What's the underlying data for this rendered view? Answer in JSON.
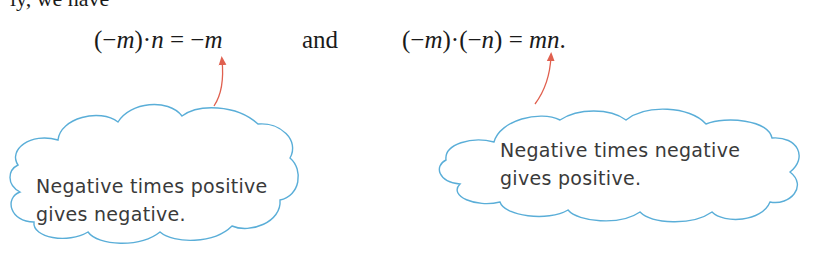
{
  "fragment_text": "ly, we have",
  "equations": {
    "left": {
      "lhs_open": "(−",
      "lhs_m": "m",
      "lhs_close": ")",
      "dot": "·",
      "lhs_n": "n",
      "eq": " = ",
      "rhs_sign": "−",
      "rhs_m": "m"
    },
    "conjunction": "and",
    "right": {
      "lhs_open1": "(−",
      "lhs_m": "m",
      "lhs_close1": ")",
      "dot": "·",
      "lhs_open2": "(−",
      "lhs_n": "n",
      "lhs_close2": ")",
      "eq": " = ",
      "rhs_mn": "mn",
      "period": "."
    }
  },
  "callouts": [
    {
      "line1": "Negative times positive",
      "line2": "gives negative."
    },
    {
      "line1": "Negative times negative",
      "line2": "gives positive."
    }
  ],
  "colors": {
    "cloud_stroke": "#5aaed8",
    "arrow": "#e0604f",
    "text": "#1a1a1a"
  }
}
